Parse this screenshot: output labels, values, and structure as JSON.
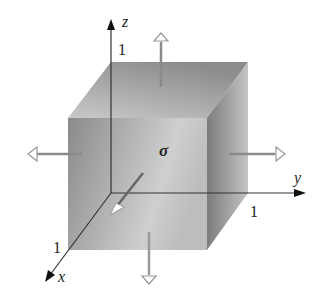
{
  "diagram": {
    "center_label": "σ",
    "axes": {
      "z": {
        "label": "z",
        "tick": "1"
      },
      "y": {
        "label": "y",
        "tick": "1"
      },
      "x": {
        "label": "x",
        "tick": "1"
      }
    },
    "arrows": [
      {
        "id": "top",
        "direction": "up",
        "style": "hollow-head"
      },
      {
        "id": "bottom",
        "direction": "down",
        "style": "hollow-head"
      },
      {
        "id": "left",
        "direction": "left",
        "style": "hollow-head"
      },
      {
        "id": "right",
        "direction": "right",
        "style": "hollow-head"
      },
      {
        "id": "front",
        "direction": "toward-viewer",
        "style": "white-head"
      }
    ],
    "colors": {
      "front_face_dark": "#8a8a8a",
      "front_face_light": "#c8c8c8",
      "top_face_dark": "#8e8e8e",
      "top_face_light": "#c6c6c6",
      "side_face_dark": "#7a7a7a",
      "side_face_light": "#bdbdbd",
      "axis": "#222222",
      "arrow_shaft": "#8a8a8a"
    }
  }
}
